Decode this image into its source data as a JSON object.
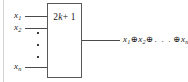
{
  "figure": {
    "type": "logic-gate-diagram",
    "gate": {
      "label_prefix": "2",
      "label_variable": "k",
      "label_suffix": "+ 1"
    },
    "inputs": [
      {
        "name": "x",
        "subscript": "1"
      },
      {
        "name": "x",
        "subscript": "2"
      },
      {
        "name": "x",
        "subscript": "n"
      }
    ],
    "vertical_ellipsis_dots": 3,
    "output": {
      "term1": "x",
      "term1_sub": "1",
      "op": "⊕",
      "term2": "x",
      "term2_sub": "2",
      "ellipsis": ". . .",
      "termn": "x",
      "termn_sub": "n"
    },
    "colors": {
      "box_stroke": "#585858",
      "wire": "#4a4a4a",
      "text": "#1a1a1a",
      "background": "#ffffff"
    }
  }
}
